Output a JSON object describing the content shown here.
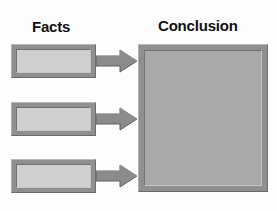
{
  "diagram": {
    "title_left": "Facts",
    "title_right": "Conclusion",
    "colors": {
      "background": "#fdfdfd",
      "frame_gray": "#8f8f8f",
      "fact_fill": "#cfcfcf",
      "conclusion_fill": "#a9a9a9",
      "arrow_fill": "#8b8b8b",
      "text": "#111111"
    },
    "facts": [
      {
        "id": "fact-1",
        "label": ""
      },
      {
        "id": "fact-2",
        "label": ""
      },
      {
        "id": "fact-3",
        "label": ""
      }
    ],
    "arrows": [
      {
        "id": "arrow-1",
        "direction": "right",
        "from": "fact-1",
        "to": "conclusion"
      },
      {
        "id": "arrow-2",
        "direction": "right",
        "from": "fact-2",
        "to": "conclusion"
      },
      {
        "id": "arrow-3",
        "direction": "right",
        "from": "fact-3",
        "to": "conclusion"
      }
    ],
    "conclusion": {
      "id": "conclusion",
      "label": ""
    }
  }
}
